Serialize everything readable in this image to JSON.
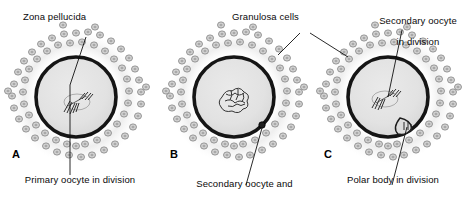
{
  "figure": {
    "type": "biological-diagram",
    "background_color": "#ffffff",
    "colors": {
      "zona_pellucida": "#1a1a1a",
      "ooplasm": "#e3e3e3",
      "granulosa_cell_fill": "#cfcfcf",
      "granulosa_cell_stroke": "#8a8a8a",
      "corona_halo": "#ededed",
      "leader_line": "#111111",
      "chromatin": "#2a2a2a",
      "text": "#0a0a0a"
    }
  },
  "labels": {
    "zona_pellucida": "Zona pellucida",
    "granulosa_cells": "Granulosa cells",
    "secondary_oocyte_in_division_line1": "Secondary oocyte",
    "secondary_oocyte_in_division_line2": "in division",
    "primary_oocyte_in_division": "Primary oocyte in division",
    "secondary_oocyte_and_polar_body_line1": "Secondary oocyte and",
    "secondary_oocyte_and_polar_body_line2": "polar body 1",
    "polar_body_in_division": "Polar body in division"
  },
  "panels": [
    {
      "letter": "A",
      "caption": "Primary oocyte in division",
      "center": {
        "x": 76,
        "y": 97
      },
      "zona_radius": 40,
      "structures": [
        "zona-pellucida",
        "ooplasm",
        "granulosa-corona",
        "meiotic-spindle"
      ],
      "has_polar_body": false
    },
    {
      "letter": "B",
      "caption": "Secondary oocyte and polar body 1",
      "center": {
        "x": 234,
        "y": 97
      },
      "zona_radius": 40,
      "structures": [
        "zona-pellucida",
        "ooplasm",
        "granulosa-corona",
        "condensed-chromatin",
        "polar-body-1"
      ],
      "has_polar_body": true
    },
    {
      "letter": "C",
      "caption": "Polar body in division",
      "center": {
        "x": 388,
        "y": 97
      },
      "zona_radius": 40,
      "structures": [
        "zona-pellucida",
        "ooplasm",
        "granulosa-corona",
        "meiotic-spindle",
        "dividing-polar-body"
      ],
      "has_polar_body": true
    }
  ]
}
